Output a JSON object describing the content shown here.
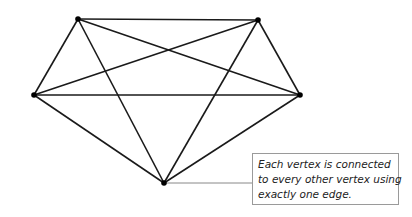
{
  "diagram": {
    "vertices": [
      {
        "id": "top-left",
        "x": 78,
        "y": 19
      },
      {
        "id": "top-right",
        "x": 258,
        "y": 20
      },
      {
        "id": "left",
        "x": 34,
        "y": 95
      },
      {
        "id": "right",
        "x": 300,
        "y": 95
      },
      {
        "id": "bottom",
        "x": 164,
        "y": 183
      }
    ],
    "edges": [
      [
        "top-left",
        "top-right"
      ],
      [
        "top-left",
        "left"
      ],
      [
        "top-left",
        "right"
      ],
      [
        "top-left",
        "bottom"
      ],
      [
        "top-right",
        "left"
      ],
      [
        "top-right",
        "right"
      ],
      [
        "top-right",
        "bottom"
      ],
      [
        "left",
        "right"
      ],
      [
        "left",
        "bottom"
      ],
      [
        "right",
        "bottom"
      ]
    ],
    "colors": {
      "edge": "#1a1a1a",
      "vertex": "#000000",
      "callout_border": "#9a9a9a",
      "leader": "#888888"
    }
  },
  "callout": {
    "lines": [
      "Each vertex is connected",
      "to every other vertex using",
      "exactly one edge."
    ]
  }
}
